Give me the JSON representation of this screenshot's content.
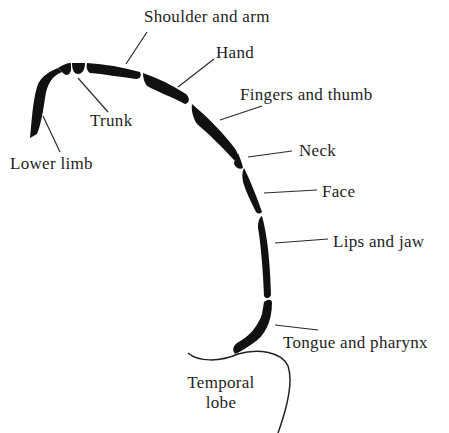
{
  "diagram": {
    "type": "motor homunculus strip (cortical representation)",
    "colors": {
      "strip": "#111111",
      "lines": "#2a2a2a",
      "text": "#1e1e1e",
      "background": "#ffffff"
    },
    "labels": {
      "shoulder_and_arm": "Shoulder and arm",
      "hand": "Hand",
      "fingers_and_thumb": "Fingers and thumb",
      "trunk": "Trunk",
      "lower_limb": "Lower limb",
      "neck": "Neck",
      "face": "Face",
      "lips_and_jaw": "Lips and jaw",
      "tongue_and_pharynx": "Tongue and pharynx",
      "temporal_lobe_line1": "Temporal",
      "temporal_lobe_line2": "lobe"
    },
    "segments_order": [
      "Lower limb",
      "Trunk",
      "Shoulder and arm",
      "Hand",
      "Fingers and thumb",
      "Neck",
      "Face",
      "Lips and jaw",
      "Tongue and pharynx"
    ]
  }
}
